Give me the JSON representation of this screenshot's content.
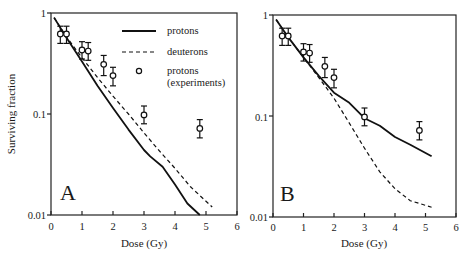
{
  "chart_data": [
    {
      "type": "line",
      "panel_label": "A",
      "title": "",
      "xlabel": "Dose (Gy)",
      "ylabel": "Surviving fraction",
      "xlim": [
        0,
        6
      ],
      "ylim": [
        0.01,
        1
      ],
      "yscale": "log",
      "xticks": [
        "0",
        "1",
        "2",
        "3",
        "4",
        "5",
        "6"
      ],
      "yticks": [
        "0.01",
        "0.1",
        "1"
      ],
      "grid": false,
      "legend_position": "upper right",
      "legend": [
        "protons",
        "deuterons",
        "protons (experiments)"
      ],
      "series": [
        {
          "name": "protons",
          "style": "solid",
          "x": [
            0.1,
            0.5,
            1.0,
            1.5,
            2.0,
            2.5,
            3.0,
            3.2,
            3.6,
            4.0,
            4.4,
            4.8
          ],
          "y": [
            0.9,
            0.57,
            0.33,
            0.19,
            0.115,
            0.07,
            0.044,
            0.038,
            0.03,
            0.02,
            0.013,
            0.01
          ]
        },
        {
          "name": "deuterons",
          "style": "dashed",
          "x": [
            0.1,
            0.5,
            1.0,
            1.5,
            2.0,
            2.5,
            3.0,
            3.5,
            4.0,
            4.5,
            5.2
          ],
          "y": [
            0.9,
            0.58,
            0.36,
            0.23,
            0.15,
            0.1,
            0.065,
            0.043,
            0.029,
            0.019,
            0.012
          ]
        },
        {
          "name": "protons (experiments)",
          "style": "markers",
          "x": [
            0.3,
            0.5,
            1.0,
            1.2,
            1.7,
            2.0,
            3.0,
            4.8
          ],
          "y": [
            0.62,
            0.62,
            0.43,
            0.42,
            0.31,
            0.24,
            0.098,
            0.072
          ],
          "err_low": [
            0.5,
            0.5,
            0.35,
            0.34,
            0.24,
            0.19,
            0.08,
            0.058
          ],
          "err_high": [
            0.74,
            0.74,
            0.52,
            0.51,
            0.38,
            0.29,
            0.12,
            0.088
          ]
        }
      ]
    },
    {
      "type": "line",
      "panel_label": "B",
      "title": "",
      "xlabel": "Dose (Gy)",
      "ylabel": "",
      "xlim": [
        0,
        6
      ],
      "ylim": [
        0.01,
        1
      ],
      "yscale": "log",
      "xticks": [
        "0",
        "1",
        "2",
        "3",
        "4",
        "5",
        "6"
      ],
      "yticks": [
        "0.01",
        "0.1",
        "1"
      ],
      "grid": false,
      "series": [
        {
          "name": "protons",
          "style": "solid",
          "x": [
            0.1,
            0.5,
            1.0,
            1.5,
            2.0,
            2.5,
            3.0,
            3.5,
            4.0,
            4.5,
            5.2
          ],
          "y": [
            0.9,
            0.6,
            0.38,
            0.25,
            0.17,
            0.135,
            0.095,
            0.08,
            0.062,
            0.052,
            0.04
          ]
        },
        {
          "name": "deuterons",
          "style": "dashed",
          "x": [
            0.1,
            0.5,
            1.0,
            1.5,
            2.0,
            2.5,
            3.0,
            3.5,
            4.0,
            4.5,
            5.2
          ],
          "y": [
            0.9,
            0.6,
            0.38,
            0.24,
            0.15,
            0.085,
            0.048,
            0.028,
            0.019,
            0.0145,
            0.0125
          ]
        },
        {
          "name": "protons (experiments)",
          "style": "markers",
          "x": [
            0.3,
            0.5,
            1.0,
            1.2,
            1.7,
            2.0,
            3.0,
            4.8
          ],
          "y": [
            0.62,
            0.62,
            0.43,
            0.42,
            0.31,
            0.24,
            0.098,
            0.072
          ],
          "err_low": [
            0.5,
            0.5,
            0.35,
            0.34,
            0.24,
            0.19,
            0.08,
            0.058
          ],
          "err_high": [
            0.74,
            0.74,
            0.52,
            0.51,
            0.38,
            0.29,
            0.12,
            0.088
          ]
        }
      ]
    }
  ],
  "labels": {
    "ylabel": "Surviving fraction",
    "xlabel": "Dose (Gy)",
    "panel_a": "A",
    "panel_b": "B",
    "legend_protons": "protons",
    "legend_deuterons": "deuterons",
    "legend_exp_line1": "protons",
    "legend_exp_line2": "(experiments)",
    "ytick_1": "1",
    "ytick_01": "0.1",
    "ytick_001": "0.01",
    "xticks": [
      "0",
      "1",
      "2",
      "3",
      "4",
      "5",
      "6"
    ]
  }
}
